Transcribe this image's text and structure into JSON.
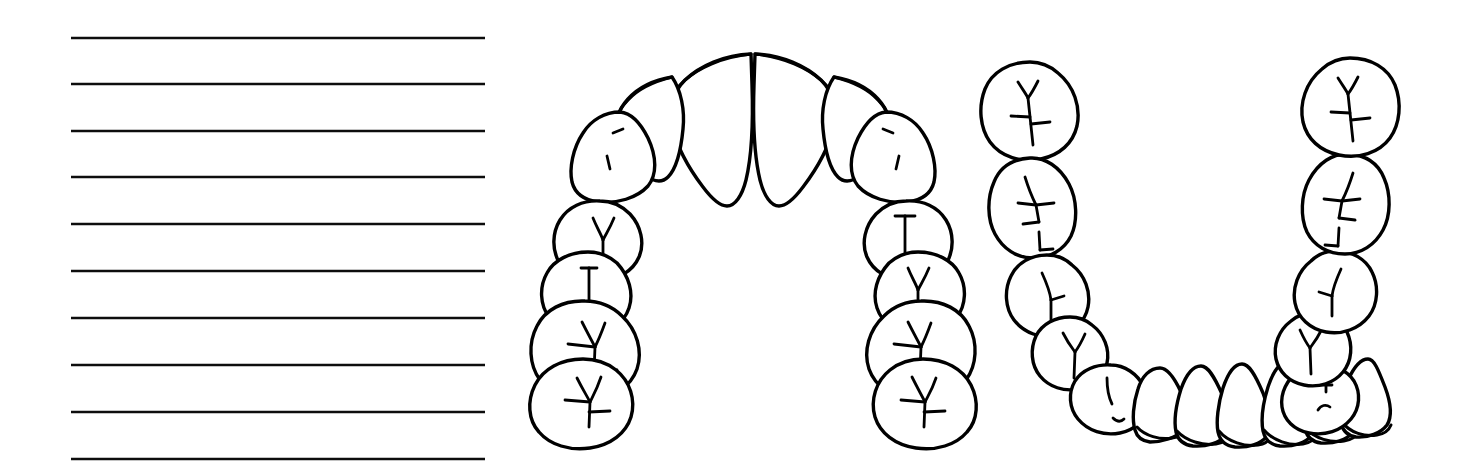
{
  "page": {
    "width": 1466,
    "height": 473,
    "background_color": "#ffffff",
    "ink_color": "#000000"
  },
  "notes_panel": {
    "name": "Ruled writing lines",
    "line_count": 10,
    "line_color": "#0d0d0d",
    "line_thickness_px": 2.6,
    "x_start": 71,
    "x_end": 485,
    "line_y_positions": [
      38,
      84,
      131,
      177,
      224,
      271,
      318,
      365,
      412,
      459
    ],
    "line_spacing_px": 47
  },
  "maxillary_arch": {
    "label": "Maxillary (upper) dental arch — occlusal view",
    "tooth_count": 14,
    "bounds": {
      "x": 533,
      "y": 48,
      "width": 437,
      "height": 382
    },
    "teeth": [
      {
        "position": "upper-left-second-molar",
        "type": "molar",
        "fissure": "y-groove"
      },
      {
        "position": "upper-left-first-molar",
        "type": "molar",
        "fissure": "y-groove"
      },
      {
        "position": "upper-left-second-premolar",
        "type": "premolar",
        "fissure": "central-groove"
      },
      {
        "position": "upper-left-first-premolar",
        "type": "premolar",
        "fissure": "y-groove"
      },
      {
        "position": "upper-left-canine",
        "type": "canine",
        "fissure": "two-ridges"
      },
      {
        "position": "upper-left-lateral-incisor",
        "type": "incisor",
        "fissure": "incisal-edge"
      },
      {
        "position": "upper-left-central-incisor",
        "type": "incisor",
        "fissure": "incisal-edge"
      },
      {
        "position": "upper-right-central-incisor",
        "type": "incisor",
        "fissure": "incisal-edge"
      },
      {
        "position": "upper-right-lateral-incisor",
        "type": "incisor",
        "fissure": "incisal-edge"
      },
      {
        "position": "upper-right-canine",
        "type": "canine",
        "fissure": "two-ridges"
      },
      {
        "position": "upper-right-first-premolar",
        "type": "premolar",
        "fissure": "central-groove"
      },
      {
        "position": "upper-right-second-premolar",
        "type": "premolar",
        "fissure": "y-groove"
      },
      {
        "position": "upper-right-first-molar",
        "type": "molar",
        "fissure": "y-groove"
      },
      {
        "position": "upper-right-second-molar",
        "type": "molar",
        "fissure": "y-groove"
      }
    ]
  },
  "mandibular_arch": {
    "label": "Mandibular (lower) dental arch — occlusal view",
    "tooth_count": 16,
    "bounds": {
      "x": 980,
      "y": 55,
      "width": 420,
      "height": 375
    },
    "teeth": [
      {
        "position": "lower-left-third-molar",
        "type": "molar",
        "fissure": "cross-groove"
      },
      {
        "position": "lower-left-second-molar",
        "type": "molar",
        "fissure": "branched-groove"
      },
      {
        "position": "lower-left-first-molar",
        "type": "molar",
        "fissure": "central-groove"
      },
      {
        "position": "lower-left-second-premolar",
        "type": "premolar",
        "fissure": "y-groove"
      },
      {
        "position": "lower-left-first-premolar",
        "type": "premolar",
        "fissure": "short-groove"
      },
      {
        "position": "lower-left-canine",
        "type": "canine",
        "fissure": "incisal-edge"
      },
      {
        "position": "lower-left-lateral-incisor",
        "type": "incisor",
        "fissure": "incisal-edge"
      },
      {
        "position": "lower-left-central-incisor",
        "type": "incisor",
        "fissure": "incisal-edge"
      },
      {
        "position": "lower-right-central-incisor",
        "type": "incisor",
        "fissure": "incisal-edge"
      },
      {
        "position": "lower-right-lateral-incisor",
        "type": "incisor",
        "fissure": "incisal-edge"
      },
      {
        "position": "lower-right-canine",
        "type": "canine",
        "fissure": "incisal-edge"
      },
      {
        "position": "lower-right-first-premolar",
        "type": "premolar",
        "fissure": "short-groove"
      },
      {
        "position": "lower-right-second-premolar",
        "type": "premolar",
        "fissure": "y-groove"
      },
      {
        "position": "lower-right-first-molar",
        "type": "molar",
        "fissure": "y-groove"
      },
      {
        "position": "lower-right-second-molar",
        "type": "molar",
        "fissure": "branched-groove"
      },
      {
        "position": "lower-right-third-molar",
        "type": "molar",
        "fissure": "cross-groove"
      }
    ]
  }
}
